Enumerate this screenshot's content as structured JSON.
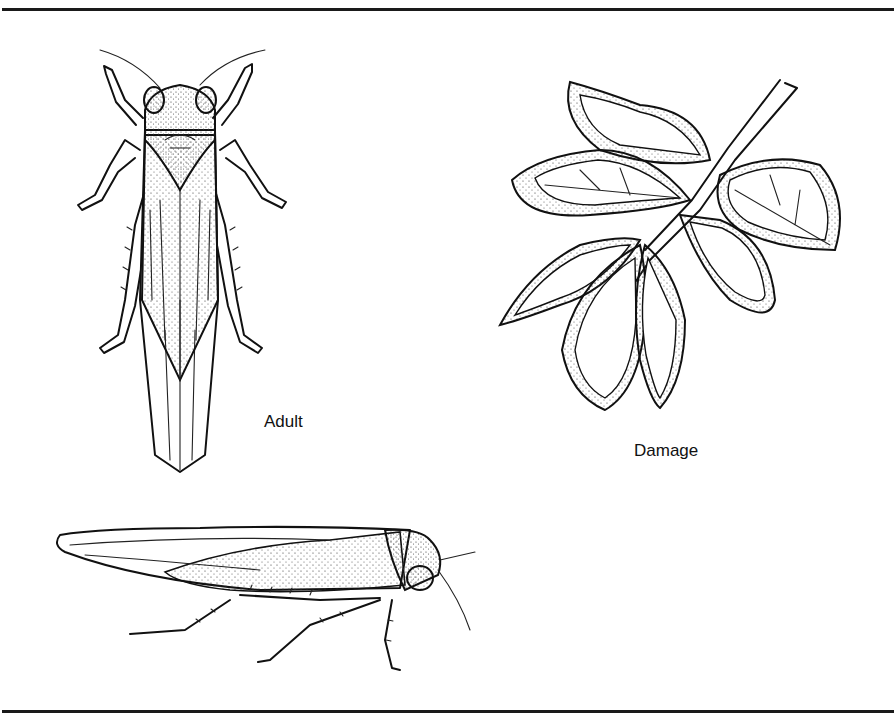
{
  "figure": {
    "labels": {
      "adult": "Adult",
      "damage": "Damage"
    },
    "illustrations": [
      {
        "id": "adult-dorsal",
        "description": "Leafhopper adult, dorsal view"
      },
      {
        "id": "damage-leaves",
        "description": "Potato leaf cluster showing hopperburn damage"
      },
      {
        "id": "adult-lateral",
        "description": "Leafhopper adult, lateral view"
      }
    ],
    "colors": {
      "ink": "#111111",
      "background": "#ffffff"
    }
  }
}
